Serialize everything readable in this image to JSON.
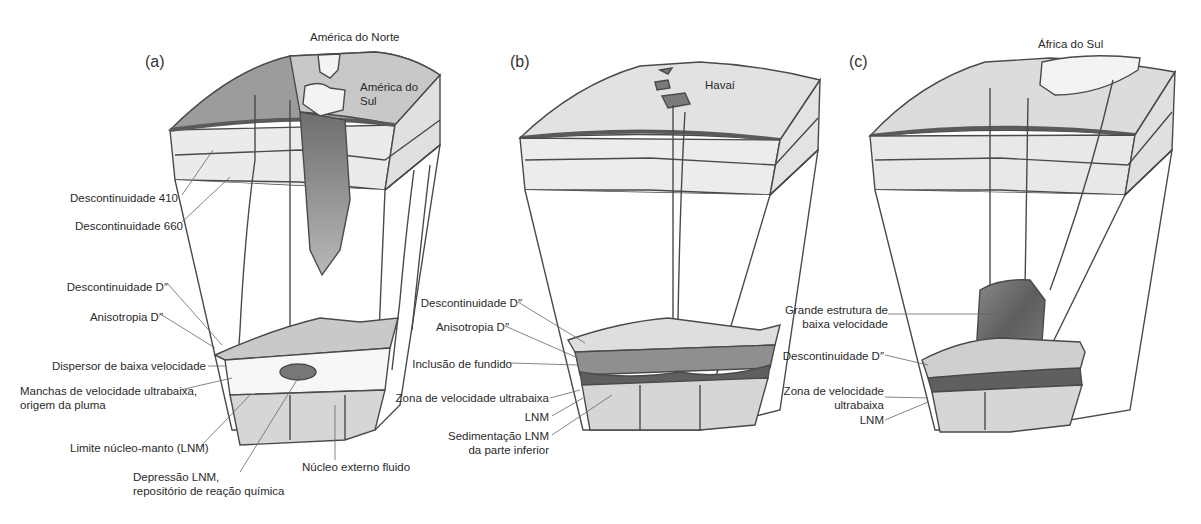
{
  "figure": {
    "panels": [
      {
        "id": "a",
        "label": "(a)",
        "surface_labels": [
          "América do Norte",
          "América do",
          "Sul"
        ],
        "callouts": [
          "Descontinuidade 410",
          "Descontinuidade 660",
          "Descontinuidade D″",
          "Anisotropia D″",
          "Dispersor de baixa velocidade",
          "Manchas de velocidade ultrabaixa,",
          "origem da pluma",
          "Limite núcleo-manto (LNM)",
          "Depressão LNM,",
          "repositório de reação química",
          "Núcleo externo fluido"
        ]
      },
      {
        "id": "b",
        "label": "(b)",
        "surface_labels": [
          "Havaí"
        ],
        "callouts": [
          "Descontinuidade D″",
          "Anisotropia D″",
          "Inclusão de fundido",
          "Zona de velocidade ultrabaixa",
          "LNM",
          "Sedimentação LNM",
          "da parte inferior"
        ]
      },
      {
        "id": "c",
        "label": "(c)",
        "surface_labels": [
          "África do Sul"
        ],
        "callouts": [
          "Grande estrutura de",
          "baixa velocidade",
          "Descontinuidade D″",
          "Zona de velocidade",
          "ultrabaixa",
          "LNM"
        ]
      }
    ],
    "colors": {
      "outline": "#4a4a4a",
      "crust_dark": "#8a8a8a",
      "mantle_light": "#e6e6e6",
      "slab": "#9a9a9a",
      "ulvz": "#6f6f6f",
      "core": "#d4d4d4"
    }
  }
}
